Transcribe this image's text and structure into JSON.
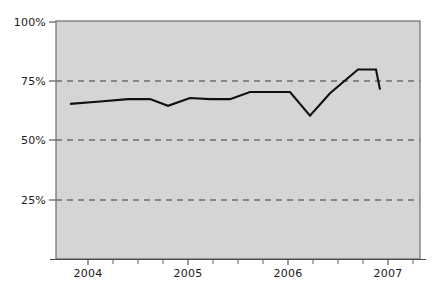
{
  "chart_data": {
    "type": "line",
    "title": "",
    "subtitle": "",
    "xlabel": "",
    "ylabel": "",
    "xlim": [
      2003.7,
      2007.3
    ],
    "ylim": [
      0,
      100
    ],
    "grid": true,
    "grid_axis": "y",
    "legend": false,
    "legend_position": "none",
    "y_tick_labels": [
      "100%",
      "75%",
      "50%",
      "25%"
    ],
    "y_tick_values": [
      100,
      75,
      50,
      25
    ],
    "x_tick_labels": [
      "2004",
      "2005",
      "2006",
      "2007"
    ],
    "x_tick_values": [
      2004,
      2005,
      2006,
      2007
    ],
    "x_minor_ticks_per_year": 4,
    "series": [
      {
        "name": "series-1",
        "color": "#111111",
        "x": [
          2003.82,
          2004.12,
          2004.4,
          2004.62,
          2004.8,
          2005.02,
          2005.22,
          2005.42,
          2005.62,
          2005.82,
          2006.02,
          2006.22,
          2006.42,
          2006.7,
          2006.88,
          2006.92
        ],
        "values": [
          65.5,
          66.5,
          67.5,
          67.5,
          64.7,
          68.0,
          67.5,
          67.5,
          70.5,
          70.5,
          70.5,
          60.5,
          70.0,
          80.0,
          80.0,
          71.5
        ]
      }
    ],
    "annotations": []
  },
  "figure": {
    "background_color": "#ffffff",
    "plot_background_color": "#d5d5d5",
    "plot_border_color": "#6e6e6e",
    "gridline_color": "#3a3a3a",
    "line_color": "#111111",
    "tick_label_color": "#1a1a1a"
  },
  "axes": {
    "y_labels": [
      {
        "text": "100%",
        "y_px": 22
      },
      {
        "text": "75%",
        "y_px": 81
      },
      {
        "text": "50%",
        "y_px": 140
      },
      {
        "text": "25%",
        "y_px": 200
      }
    ],
    "x_labels": [
      {
        "text": "2004",
        "x_px": 88
      },
      {
        "text": "2005",
        "x_px": 188
      },
      {
        "text": "2006",
        "x_px": 288
      },
      {
        "text": "2007",
        "x_px": 388
      }
    ]
  }
}
